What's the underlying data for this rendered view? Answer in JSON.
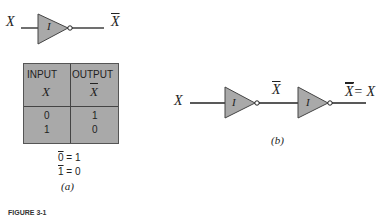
{
  "figure_a": {
    "input_label": "X",
    "gate_label": "I",
    "output_label": "X",
    "truth_table": {
      "headers": [
        {
          "title": "INPUT",
          "var": "X",
          "negated": false
        },
        {
          "title": "OUTPUT",
          "var": "X",
          "negated": true
        }
      ],
      "rows": [
        [
          "0",
          "1"
        ],
        [
          "1",
          "0"
        ]
      ]
    },
    "equations": [
      {
        "lhs": "0",
        "rhs": "= 1"
      },
      {
        "lhs": "1",
        "rhs": "= 0"
      }
    ],
    "caption": "(a)"
  },
  "figure_b": {
    "input_label": "X",
    "gate1_label": "I",
    "mid_label": "X",
    "gate2_label": "I",
    "output_label": "X",
    "output_eq": "= X",
    "caption": "(b)"
  },
  "figure_caption": "FIGURE 3-1",
  "colors": {
    "gate_fill": "#a9a9a9",
    "line": "#222222"
  }
}
